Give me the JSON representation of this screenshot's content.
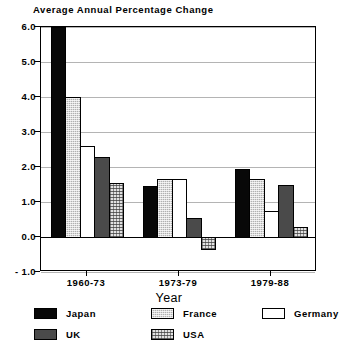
{
  "chart_data": {
    "type": "bar",
    "title": "Average Annual Percentage Change",
    "xlabel": "Year",
    "ylabel": "",
    "categories": [
      "1960-73",
      "1973-79",
      "1979-88"
    ],
    "series": [
      {
        "name": "Japan",
        "values": [
          6.0,
          1.45,
          1.95
        ],
        "color": "#080808",
        "pattern": "solid-black"
      },
      {
        "name": "France",
        "values": [
          4.0,
          1.65,
          1.65
        ],
        "color": "#b0b0b0",
        "pattern": "gray-hatch"
      },
      {
        "name": "Germany",
        "values": [
          2.6,
          1.65,
          0.75
        ],
        "color": "#ffffff",
        "pattern": "white"
      },
      {
        "name": "UK",
        "values": [
          2.3,
          0.55,
          1.5
        ],
        "color": "#4a4a4a",
        "pattern": "dark-gray"
      },
      {
        "name": "USA",
        "values": [
          1.55,
          -0.35,
          0.3
        ],
        "color": "#e2e2e2",
        "pattern": "light-crosshatch"
      }
    ],
    "ylim": [
      -1.0,
      6.0
    ],
    "yticks": [
      6.0,
      5.0,
      4.0,
      3.0,
      2.0,
      1.0,
      0.0,
      -1.0
    ],
    "ytick_labels": [
      "6.0",
      "5.0",
      "4.0",
      "3.0",
      "2.0",
      "1.0",
      "0.0",
      "- 1.0"
    ],
    "grid": true,
    "legend_position": "bottom"
  },
  "legend": {
    "entries": [
      {
        "label": "Japan",
        "series": "Japan"
      },
      {
        "label": "France",
        "series": "France"
      },
      {
        "label": "Germany",
        "series": "Germany"
      },
      {
        "label": "UK",
        "series": "UK"
      },
      {
        "label": "USA",
        "series": "USA"
      }
    ]
  }
}
